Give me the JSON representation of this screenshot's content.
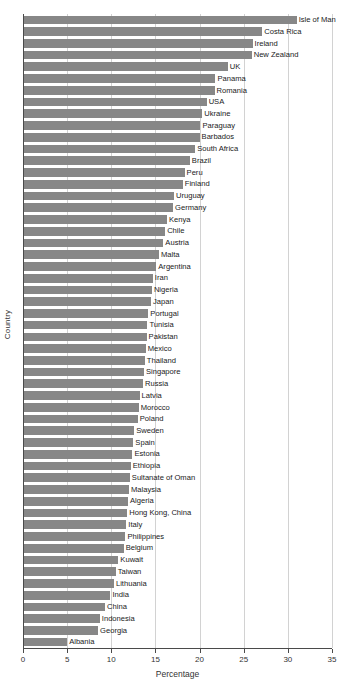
{
  "chart_data": {
    "type": "bar",
    "orientation": "horizontal",
    "title": "",
    "xlabel": "Percentage",
    "ylabel": "Country",
    "xlim": [
      0,
      35
    ],
    "xticks": [
      0,
      5,
      10,
      15,
      20,
      25,
      30,
      35
    ],
    "grid": true,
    "legend": false,
    "bar_color": "#878787",
    "categories": [
      "Isle of Man",
      "Costa Rica",
      "Ireland",
      "New Zealand",
      "UK",
      "Panama",
      "Romania",
      "USA",
      "Ukraine",
      "Paraguay",
      "Barbados",
      "South Africa",
      "Brazil",
      "Peru",
      "Finland",
      "Uruguay",
      "Germany",
      "Kenya",
      "Chile",
      "Austria",
      "Malta",
      "Argentina",
      "Iran",
      "Nigeria",
      "Japan",
      "Portugal",
      "Tunisia",
      "Pakistan",
      "Mexico",
      "Thailand",
      "Singapore",
      "Russia",
      "Latvia",
      "Morocco",
      "Poland",
      "Sweden",
      "Spain",
      "Estonia",
      "Ethiopia",
      "Sultanate of Oman",
      "Malaysia",
      "Algeria",
      "Hong Kong, China",
      "Italy",
      "Philippines",
      "Belgium",
      "Kuwait",
      "Taiwan",
      "Lithuania",
      "India",
      "China",
      "Indonesia",
      "Georgia",
      "Albania"
    ],
    "values": [
      31.0,
      27.1,
      26.0,
      25.9,
      23.2,
      21.8,
      21.7,
      20.8,
      20.3,
      20.1,
      20.0,
      19.5,
      18.9,
      18.3,
      18.1,
      17.1,
      17.0,
      16.3,
      16.1,
      15.9,
      15.4,
      15.1,
      14.7,
      14.6,
      14.5,
      14.2,
      14.1,
      14.0,
      13.9,
      13.8,
      13.7,
      13.6,
      13.2,
      13.1,
      13.0,
      12.6,
      12.5,
      12.4,
      12.2,
      12.1,
      12.0,
      11.9,
      11.8,
      11.7,
      11.6,
      11.4,
      10.8,
      10.5,
      10.3,
      9.9,
      9.3,
      8.7,
      8.5,
      5.0
    ]
  }
}
